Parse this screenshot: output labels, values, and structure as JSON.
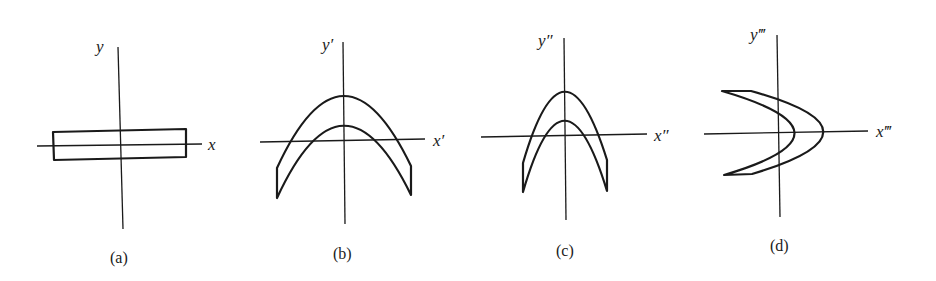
{
  "figure": {
    "panels": [
      {
        "id": "a",
        "caption": "(a)",
        "x_label": "x",
        "y_label": "y",
        "shape": "rectangle"
      },
      {
        "id": "b",
        "caption": "(b)",
        "x_label": "x′",
        "y_label": "y′",
        "shape": "wide downward parabolic band"
      },
      {
        "id": "c",
        "caption": "(c)",
        "x_label": "x″",
        "y_label": "y″",
        "shape": "narrow downward parabolic band"
      },
      {
        "id": "d",
        "caption": "(d)",
        "x_label": "x‴",
        "y_label": "y‴",
        "shape": "rightward-opening rotated parabolic band"
      }
    ]
  }
}
